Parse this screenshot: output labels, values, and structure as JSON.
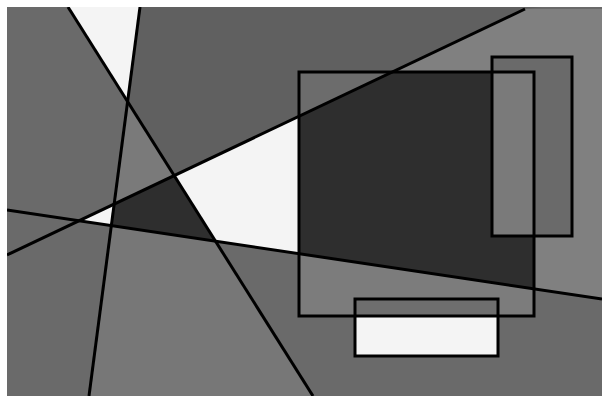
{
  "artwork": {
    "description": "Abstract grayscale composition of intersecting lines and rectangles",
    "colors": {
      "background": "#ffffff",
      "left_region": "#6a6a6a",
      "top_region": "#606060",
      "center_triangle": "#7a7a7a",
      "white_region": "#f4f4f4",
      "dark_region": "#2e2e2e",
      "bottom_left": "#6c6c6c",
      "bottom_middle": "#777777",
      "bottom_right": "#6a6a6a",
      "right_upper": "#808080",
      "inner_rect_upper": "#6c6c6c",
      "big_rect_lower": "#7c7c7c",
      "tall_rect_dark_overlap": "#7a7a7a",
      "tall_rect_light": "#6a6a6a",
      "small_rect_top": "#6e6e6e",
      "small_rect_bottom": "#f4f4f4",
      "stroke": "#000000"
    }
  }
}
